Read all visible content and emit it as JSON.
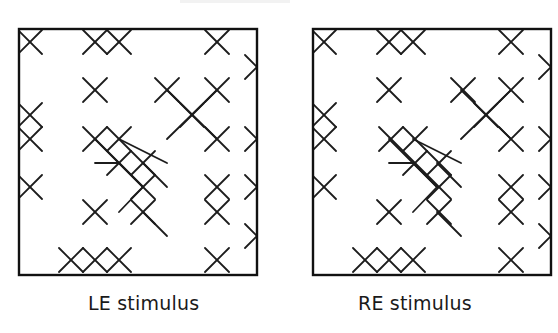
{
  "figure": {
    "panels": [
      {
        "id": "left",
        "caption": "LE stimulus",
        "box": {
          "x": 19,
          "y": 29,
          "w": 238,
          "h": 246
        },
        "caption_x": 88,
        "crosses": [
          [
            11,
            13
          ],
          [
            76,
            13
          ],
          [
            100,
            13
          ],
          [
            198,
            13
          ],
          [
            238,
            38
          ],
          [
            76,
            61
          ],
          [
            148,
            61
          ],
          [
            198,
            61
          ],
          [
            11,
            86
          ],
          [
            173,
            86
          ],
          [
            11,
            110
          ],
          [
            76,
            110
          ],
          [
            100,
            110
          ],
          [
            198,
            110
          ],
          [
            238,
            110
          ],
          [
            100,
            134
          ],
          [
            124,
            134
          ],
          [
            11,
            158
          ],
          [
            124,
            158
          ],
          [
            198,
            158
          ],
          [
            238,
            158
          ],
          [
            76,
            183
          ],
          [
            124,
            183
          ],
          [
            198,
            183
          ],
          [
            238,
            207
          ],
          [
            52,
            231
          ],
          [
            76,
            231
          ],
          [
            100,
            231
          ],
          [
            198,
            231
          ]
        ],
        "arms": [
          [
            [
              148,
              61
            ],
            [
              198,
              110
            ]
          ],
          [
            [
              198,
              61
            ],
            [
              148,
              110
            ]
          ],
          [
            [
              76,
              110
            ],
            [
              124,
              158
            ]
          ],
          [
            [
              100,
              110
            ],
            [
              148,
              134
            ]
          ],
          [
            [
              76,
              134
            ],
            [
              100,
              134
            ]
          ],
          [
            [
              100,
              134
            ],
            [
              124,
              158
            ]
          ],
          [
            [
              124,
              134
            ],
            [
              148,
              158
            ]
          ],
          [
            [
              124,
              158
            ],
            [
              100,
              183
            ]
          ],
          [
            [
              124,
              183
            ],
            [
              148,
              207
            ]
          ]
        ]
      },
      {
        "id": "right",
        "caption": "RE stimulus",
        "box": {
          "x": 313,
          "y": 29,
          "w": 238,
          "h": 246
        },
        "caption_x": 358,
        "crosses": [
          [
            11,
            13
          ],
          [
            76,
            13
          ],
          [
            100,
            13
          ],
          [
            198,
            13
          ],
          [
            238,
            38
          ],
          [
            76,
            61
          ],
          [
            150,
            61
          ],
          [
            198,
            61
          ],
          [
            11,
            86
          ],
          [
            173,
            86
          ],
          [
            11,
            110
          ],
          [
            78,
            110
          ],
          [
            102,
            110
          ],
          [
            198,
            110
          ],
          [
            238,
            110
          ],
          [
            102,
            134
          ],
          [
            126,
            134
          ],
          [
            11,
            158
          ],
          [
            126,
            158
          ],
          [
            198,
            158
          ],
          [
            238,
            158
          ],
          [
            76,
            183
          ],
          [
            126,
            183
          ],
          [
            198,
            183
          ],
          [
            238,
            207
          ],
          [
            52,
            231
          ],
          [
            76,
            231
          ],
          [
            100,
            231
          ],
          [
            198,
            231
          ]
        ],
        "arms": []
      }
    ],
    "cross_half_size": 12,
    "stroke_color": "#1c1c1c",
    "box_stroke_color": "#111111"
  }
}
